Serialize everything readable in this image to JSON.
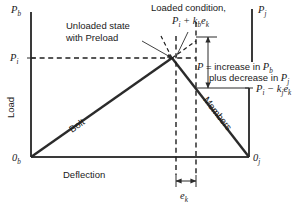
{
  "figure": {
    "type": "joint-diagram",
    "axes": {
      "y_left_top_label": "P",
      "y_left_top_sub": "b",
      "y_left_origin_label": "0",
      "y_left_origin_sub": "b",
      "y_axis_title": "Load",
      "x_axis_title": "Deflection",
      "y_right_top_label": "P",
      "y_right_top_sub": "j",
      "y_right_origin_label": "0",
      "y_right_origin_sub": "j",
      "preload_tick_label": "P",
      "preload_tick_sub": "i"
    },
    "curves": [
      {
        "name": "bolt-line",
        "label": "Bolt",
        "rotation_deg": -37
      },
      {
        "name": "members-line",
        "label": "Members",
        "rotation_deg": 56
      }
    ],
    "annotations": {
      "unloaded_line1": "Unloaded state",
      "unloaded_line2": "with Preload",
      "loaded_line1": "Loaded condition,",
      "loaded_expr_p": "P",
      "loaded_expr_p_sub": "i",
      "loaded_expr_plus": " + ",
      "loaded_expr_k": "k",
      "loaded_expr_k_sub": "b",
      "loaded_expr_e": "e",
      "loaded_expr_e_sub": "k",
      "delta_line1_a": "P",
      "delta_line1_b": " = increase in ",
      "delta_line1_c": "P",
      "delta_line1_c_sub": "b",
      "delta_line2_a": "plus decrease in ",
      "delta_line2_b": "P",
      "delta_line2_b_sub": "j",
      "lower_expr_p": "P",
      "lower_expr_p_sub": "i",
      "lower_expr_minus": " − ",
      "lower_expr_k": "k",
      "lower_expr_k_sub": "j",
      "lower_expr_e": "e",
      "lower_expr_e_sub": "k",
      "ek_label": "e",
      "ek_label_sub": "k"
    },
    "colors": {
      "line": "#2b2b2b",
      "axis": "#3a3a3a",
      "text": "#1a1a1a",
      "background": "#ffffff"
    }
  }
}
